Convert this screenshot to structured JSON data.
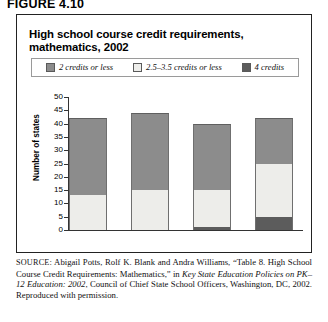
{
  "figure_label": "FIGURE 4.10",
  "chart_title": "High school course credit requirements, mathematics, 2002",
  "source": {
    "prefix": "SOURCE",
    "part1": ": Abigail Potts, Rolf K. Blank and Andra Williams, “Table 8. High School Course Credit Requirements: Mathematics,” in ",
    "italic": "Key State Education Policies on PK–12 Education: 2002",
    "part2": ", Council of Chief State School Officers, Washington, DC, 2002. Reproduced with permission."
  },
  "colors": {
    "series_2_credits_or_less": "#8c8c8c",
    "series_2535_credits_or_less": "#ededea",
    "series_4_credits": "#5c5c5c",
    "frame": "#222222",
    "axis": "#333333"
  },
  "chart_data": {
    "type": "bar",
    "subtype": "stacked",
    "title": "High school course credit requirements, mathematics, 2002",
    "xlabel": "",
    "ylabel": "Number of states",
    "ylim": [
      0,
      50
    ],
    "yticks": [
      0,
      5,
      10,
      15,
      20,
      25,
      30,
      35,
      40,
      45,
      50
    ],
    "ytick_labels": [
      "0",
      "5",
      "10",
      "15",
      "20",
      "25",
      "30",
      "35",
      "40",
      "45",
      "50"
    ],
    "grid": false,
    "legend_position": "top",
    "categories": [
      "",
      "",
      "",
      ""
    ],
    "series": [
      {
        "name": "4 credits",
        "color": "#5c5c5c",
        "values": [
          0,
          0,
          1,
          5
        ]
      },
      {
        "name": "2.5–3.5 credits or less",
        "color": "#ededea",
        "values": [
          13,
          15,
          14,
          20
        ]
      },
      {
        "name": "2 credits or less",
        "color": "#8c8c8c",
        "values": [
          29,
          29,
          25,
          17
        ]
      }
    ],
    "totals": [
      42,
      44,
      40,
      42
    ]
  },
  "legend": [
    {
      "label": "2 credits or less",
      "color": "#8c8c8c"
    },
    {
      "label": "2.5–3.5 credits or less",
      "color": "#ededea"
    },
    {
      "label": "4 credits",
      "color": "#5c5c5c"
    }
  ]
}
